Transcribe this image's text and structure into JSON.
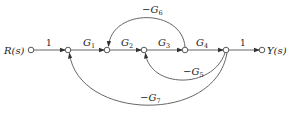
{
  "diagram": {
    "type": "signal-flow-graph",
    "input_label": "R(s)",
    "output_label": "Y(s)",
    "nodes": [
      {
        "id": "R",
        "x": 31,
        "y": 50,
        "label": "R(s)"
      },
      {
        "id": "n2",
        "x": 68,
        "y": 50
      },
      {
        "id": "n3",
        "x": 107,
        "y": 50
      },
      {
        "id": "n4",
        "x": 144,
        "y": 50
      },
      {
        "id": "n5",
        "x": 185,
        "y": 50
      },
      {
        "id": "n6",
        "x": 226,
        "y": 50
      },
      {
        "id": "Y",
        "x": 262,
        "y": 50,
        "label": "Y(s)"
      }
    ],
    "forward_branches": [
      {
        "from": "R",
        "to": "n2",
        "gain": "1"
      },
      {
        "from": "n2",
        "to": "n3",
        "gain": "G1"
      },
      {
        "from": "n3",
        "to": "n4",
        "gain": "G2"
      },
      {
        "from": "n4",
        "to": "n5",
        "gain": "G3"
      },
      {
        "from": "n5",
        "to": "n6",
        "gain": "G4"
      },
      {
        "from": "n6",
        "to": "Y",
        "gain": "1"
      }
    ],
    "feedback_branches": [
      {
        "from": "n5",
        "to": "n3",
        "gain": "-G6"
      },
      {
        "from": "n6",
        "to": "n4",
        "gain": "-G5"
      },
      {
        "from": "n6",
        "to": "n2",
        "gain": "-G7"
      }
    ],
    "labels": {
      "r": "R(s)",
      "y": "Y(s)",
      "one_in": "1",
      "one_out": "1",
      "g1": "G",
      "g1_sub": "1",
      "g2": "G",
      "g2_sub": "2",
      "g3": "G",
      "g3_sub": "3",
      "g4": "G",
      "g4_sub": "4",
      "g5": "−G",
      "g5_sub": "5",
      "g6": "−G",
      "g6_sub": "6",
      "g7": "−G",
      "g7_sub": "7"
    }
  }
}
